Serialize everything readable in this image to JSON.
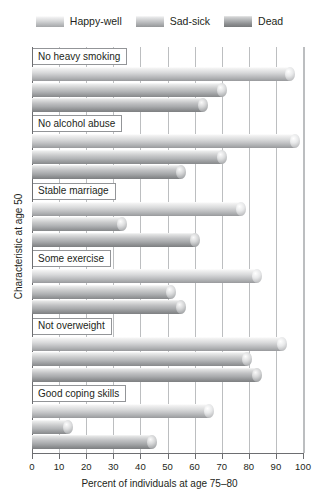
{
  "chart_data": {
    "type": "bar",
    "orientation": "horizontal",
    "title": "",
    "xlabel": "Percent of individuals at age 75–80",
    "ylabel": "Characteristic at age 50",
    "xlim": [
      0,
      100
    ],
    "xticks": [
      0,
      10,
      20,
      30,
      40,
      50,
      60,
      70,
      80,
      90,
      100
    ],
    "xticklabels": [
      "0",
      "10",
      "20",
      "30",
      "40",
      "50",
      "60",
      "70",
      "80",
      "90",
      "100"
    ],
    "grid": "vertical",
    "legend_position": "top-center",
    "categories": [
      "No heavy smoking",
      "No alcohol abuse",
      "Stable marriage",
      "Some exercise",
      "Not overweight",
      "Good coping skills"
    ],
    "series": [
      {
        "name": "Happy-well",
        "color": "#c9cacb",
        "values": [
          97,
          99,
          79,
          85,
          94,
          67
        ]
      },
      {
        "name": "Sad-sick",
        "color": "#b0b2b4",
        "values": [
          72,
          72,
          35,
          53,
          81,
          15
        ]
      },
      {
        "name": "Dead",
        "color": "#8e9092",
        "values": [
          65,
          57,
          62,
          57,
          85,
          46
        ]
      }
    ]
  },
  "legend": {
    "items": [
      {
        "label": "Happy-well",
        "swatch": "legend-swatch-happy-well"
      },
      {
        "label": "Sad-sick",
        "swatch": "legend-swatch-sad-sick"
      },
      {
        "label": "Dead",
        "swatch": "legend-swatch-dead"
      }
    ]
  }
}
